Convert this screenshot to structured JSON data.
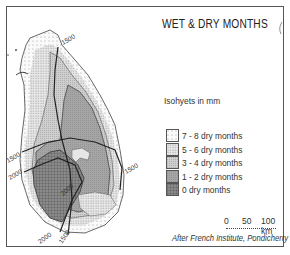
{
  "title": "WET & DRY MONTHS",
  "isohyet_caption": "Isohyets in mm",
  "legend": {
    "items": [
      {
        "label": "7 - 8 dry months",
        "pattern": "sparse-dots"
      },
      {
        "label": "5 - 6 dry months",
        "pattern": "dense-dots"
      },
      {
        "label": "3 - 4 dry months",
        "pattern": "light-stipple"
      },
      {
        "label": "1 - 2 dry months",
        "pattern": "medium-gray"
      },
      {
        "label": "0 dry months",
        "pattern": "crosshatch"
      }
    ]
  },
  "scale_bar": {
    "ticks": [
      "0",
      "50",
      "100 km"
    ]
  },
  "credit": "After French Institute, Pondicherry",
  "contour_labels": {
    "north": "1500",
    "west_upper": "1500",
    "west_lower": "2000",
    "east": "1500",
    "center": "2000",
    "south_a": "2000",
    "south_b": "1500"
  },
  "colors": {
    "frame": "#555555",
    "sparse_dots": "#f2f2f2",
    "dense_dots": "#d9d9d9",
    "light_stipple": "#c4c4c4",
    "medium_gray": "#9e9e9e",
    "crosshatch": "#7a7a7a"
  }
}
